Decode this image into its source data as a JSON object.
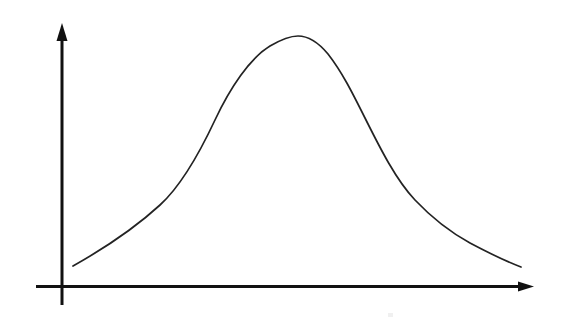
{
  "figure": {
    "title": "Bell curve (normal distribution) sketch",
    "background_color": "#ffffff",
    "ink_color": "#111111",
    "curve_color": "#232323",
    "canvas": {
      "width": 565,
      "height": 328
    }
  },
  "axes": {
    "y_axis": {
      "name": "vertical axis",
      "x": 62,
      "top": 24,
      "bottom": 305,
      "stroke_width": 3,
      "arrow": "up"
    },
    "x_axis": {
      "name": "horizontal axis",
      "y": 286,
      "left": 36,
      "right": 533,
      "stroke_width": 3,
      "arrow": "right"
    },
    "origin": {
      "x": 62,
      "y": 286
    },
    "tick_labels_x": [],
    "tick_labels_y": [],
    "xlabel": "",
    "ylabel": ""
  },
  "artifacts": {
    "speck": {
      "x": 388,
      "y": 313,
      "width": 5,
      "height": 4,
      "color": "#f0f0f0"
    }
  },
  "chart_data": {
    "type": "line",
    "title": "",
    "subtitle": "",
    "xlabel": "",
    "ylabel": "",
    "grid": false,
    "legend": null,
    "legend_position": "none",
    "axis_arrows": true,
    "xlim": [
      62,
      533
    ],
    "ylim": [
      286,
      24
    ],
    "annotations": [],
    "series": [
      {
        "name": "bell curve",
        "shape": "normal distribution",
        "peak": {
          "x": 298,
          "y": 36
        },
        "start": {
          "x": 73,
          "y": 266
        },
        "end": {
          "x": 521,
          "y": 267
        },
        "x": [
          73,
          100,
          130,
          160,
          190,
          215,
          240,
          265,
          282,
          298,
          315,
          333,
          355,
          385,
          415,
          430,
          455,
          470,
          500,
          521
        ],
        "y": [
          266,
          248,
          225,
          205,
          163,
          120,
          80,
          52,
          41,
          36,
          38,
          52,
          88,
          140,
          195,
          200,
          222,
          235,
          255,
          267
        ],
        "path": "M 73 266 C 105 248 135 228 160 205 C 182 185 200 152 215 120 C 230 88 250 58 270 46 C 282 39 290 36 298 36 C 308 36 318 42 328 54 C 342 72 352 92 365 118 C 380 148 396 180 415 200 C 432 218 450 232 470 243 C 487 252 505 261 521 267"
      }
    ]
  }
}
